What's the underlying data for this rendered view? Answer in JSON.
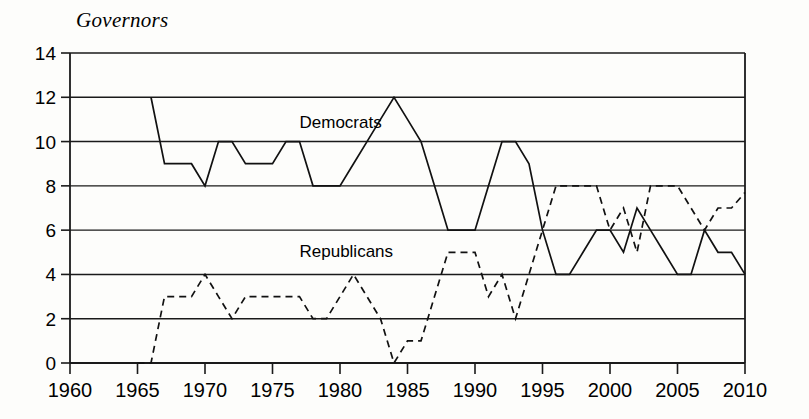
{
  "chart_data": {
    "type": "line",
    "title": "Governors",
    "xlabel": "",
    "ylabel": "Governors",
    "xlim": [
      1960,
      2010
    ],
    "ylim": [
      0,
      14
    ],
    "grid": true,
    "legend": "inline-annotations",
    "xticks": [
      1960,
      1965,
      1970,
      1975,
      1980,
      1985,
      1990,
      1995,
      2000,
      2005,
      2010
    ],
    "yticks": [
      0,
      2,
      4,
      6,
      8,
      10,
      12,
      14
    ],
    "annotations": [
      {
        "text": "Democrats",
        "x": 1977,
        "y": 10.6
      },
      {
        "text": "Republicans",
        "x": 1977,
        "y": 4.8
      }
    ],
    "series": [
      {
        "name": "Democrats",
        "style": "solid",
        "x": [
          1966,
          1967,
          1968,
          1969,
          1970,
          1971,
          1972,
          1973,
          1974,
          1975,
          1976,
          1977,
          1978,
          1979,
          1980,
          1981,
          1982,
          1983,
          1984,
          1985,
          1986,
          1987,
          1988,
          1989,
          1990,
          1991,
          1992,
          1993,
          1994,
          1995,
          1996,
          1997,
          1998,
          1999,
          2000,
          2001,
          2002,
          2003,
          2004,
          2005,
          2006,
          2007,
          2008,
          2009,
          2010
        ],
        "values": [
          12,
          9,
          9,
          9,
          8,
          10,
          10,
          9,
          9,
          9,
          10,
          10,
          8,
          8,
          8,
          9,
          10,
          11,
          12,
          11,
          10,
          8,
          6,
          6,
          6,
          8,
          10,
          10,
          9,
          6,
          4,
          4,
          5,
          6,
          6,
          5,
          7,
          6,
          5,
          4,
          4,
          6,
          5,
          5,
          4
        ]
      },
      {
        "name": "Republicans",
        "style": "dashed",
        "x": [
          1965,
          1966,
          1967,
          1968,
          1969,
          1970,
          1971,
          1972,
          1973,
          1974,
          1975,
          1976,
          1977,
          1978,
          1979,
          1980,
          1981,
          1982,
          1983,
          1984,
          1985,
          1986,
          1987,
          1988,
          1989,
          1990,
          1991,
          1992,
          1993,
          1994,
          1995,
          1996,
          1997,
          1998,
          1999,
          2000,
          2001,
          2002,
          2003,
          2004,
          2005,
          2006,
          2007,
          2008,
          2009,
          2010
        ],
        "values": [
          0,
          0,
          3,
          3,
          3,
          4,
          3,
          2,
          3,
          3,
          3,
          3,
          3,
          2,
          2,
          3,
          4,
          3,
          2,
          0,
          1,
          1,
          3,
          5,
          5,
          5,
          3,
          4,
          2,
          4,
          6,
          8,
          8,
          8,
          8,
          6,
          7,
          5,
          8,
          8,
          8,
          7,
          6,
          7,
          7,
          7.7
        ]
      }
    ]
  },
  "axes": {
    "y_labels": [
      "14",
      "12",
      "10",
      "8",
      "6",
      "4",
      "2",
      "0"
    ],
    "x_labels": [
      "1960",
      "1965",
      "1970",
      "1975",
      "1980",
      "1985",
      "1990",
      "1995",
      "2000",
      "2005",
      "2010"
    ]
  },
  "labels": {
    "democrats": "Democrats",
    "republicans": "Republicans",
    "title": "Governors"
  }
}
